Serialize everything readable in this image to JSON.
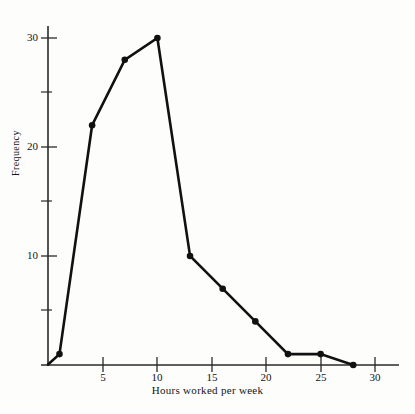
{
  "chart_data": {
    "type": "line",
    "title": "",
    "subtitle": "",
    "xlabel": "Hours worked per week",
    "ylabel": "Frequency",
    "x": [
      1,
      4,
      7,
      10,
      13,
      16,
      19,
      22,
      25,
      28
    ],
    "values": [
      1,
      22,
      28,
      30,
      10,
      7,
      4,
      1,
      1,
      0
    ],
    "series": [
      {
        "name": "Frequency",
        "x": [
          1,
          4,
          7,
          10,
          13,
          16,
          19,
          22,
          25,
          28
        ],
        "values": [
          1,
          22,
          28,
          30,
          10,
          7,
          4,
          1,
          1,
          0
        ]
      }
    ],
    "xlim": [
      0,
      31
    ],
    "ylim": [
      0,
      32
    ],
    "x_major_ticks": [
      5,
      10,
      15,
      20,
      25,
      30
    ],
    "x_tick_labels": [
      "5",
      "10",
      "15",
      "20",
      "25",
      "30"
    ],
    "y_major_ticks": [
      10,
      20,
      30
    ],
    "y_tick_labels": [
      "10",
      "20",
      "30"
    ],
    "y_minor_ticks": [
      5,
      15,
      25
    ],
    "grid": false,
    "legend": "none",
    "marker": "filled-circle",
    "line_color": "#111111",
    "marker_color": "#111111",
    "axis_color": "#2a2a2a",
    "background_color": "#fdfdfc"
  },
  "axes": {
    "x_title": "Hours worked per week",
    "y_title": "Frequency"
  }
}
